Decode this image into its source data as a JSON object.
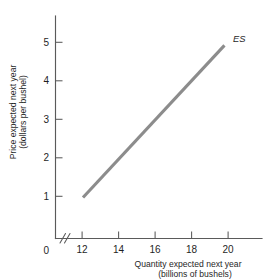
{
  "chart_data": {
    "type": "line",
    "title": "",
    "xlabel": "Quantity expected next year",
    "xlabel_line2": "(billions of bushels)",
    "ylabel": "Price expected next year",
    "ylabel_line2": "(dollars per bushel)",
    "xlim": [
      11.2,
      21.4
    ],
    "ylim": [
      0,
      5.6
    ],
    "x_ticks": [
      12,
      14,
      16,
      18,
      20
    ],
    "x_tick_labels": [
      "12",
      "14",
      "16",
      "18",
      "20"
    ],
    "y_ticks": [
      1,
      2,
      3,
      4,
      5
    ],
    "y_tick_labels": [
      "1",
      "2",
      "3",
      "4",
      "5"
    ],
    "origin_label": "0",
    "axis_break": "//",
    "grid": false,
    "legend_position": "inline-curve-end",
    "series": [
      {
        "name": "ES",
        "label": "ES",
        "color": "#8c8c8c",
        "x": [
          12.05,
          19.8
        ],
        "values": [
          0.97,
          4.92
        ]
      }
    ]
  },
  "colors": {
    "background": "#ffffff",
    "axis": "#5a5a5a",
    "text": "#1f1f1f",
    "series": "#8c8c8c"
  }
}
